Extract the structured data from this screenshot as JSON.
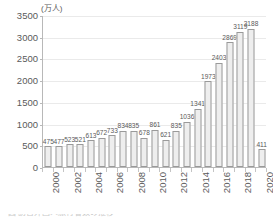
{
  "chart_data": {
    "type": "bar",
    "title": "",
    "subtitle": "",
    "unit_label": "(万人)",
    "xlabel": "",
    "ylabel": "",
    "ylim": [
      0,
      3500
    ],
    "ytick_step": 500,
    "yticks": [
      "0",
      "500",
      "1000",
      "1500",
      "2000",
      "2500",
      "3000",
      "3500"
    ],
    "grid": true,
    "legend": "none",
    "categories": [
      "2000",
      "2001",
      "2002",
      "2003",
      "2004",
      "2005",
      "2006",
      "2007",
      "2008",
      "2009",
      "2010",
      "2011",
      "2012",
      "2013",
      "2014",
      "2015",
      "2016",
      "2017",
      "2018",
      "2019",
      "2020"
    ],
    "xtick_labels": [
      "2000",
      "2002",
      "2004",
      "2006",
      "2008",
      "2010",
      "2012",
      "2014",
      "2016",
      "2018",
      "2020"
    ],
    "values": [
      475,
      477,
      523,
      521,
      613,
      672,
      733,
      834,
      835,
      678,
      861,
      621,
      835,
      1036,
      1341,
      1973,
      2403,
      2869,
      3119,
      3188,
      411
    ],
    "data_labels": [
      "475",
      "477",
      "523",
      "521",
      "613",
      "672",
      "733",
      "834",
      "835",
      "678",
      "861",
      "621",
      "835",
      "1036",
      "1341",
      "1973",
      "2403",
      "2869",
      "3119",
      "3188",
      "411"
    ],
    "colors": {
      "bar_fill": "#eeeeee",
      "bar_stroke": "#9a9a9a",
      "axis": "#b8b8b8",
      "gridline": "#eaeaea",
      "text": "#5a5a5a"
    }
  },
  "caption": {
    "text": "図   訪日外国人旅行者数の推移"
  }
}
